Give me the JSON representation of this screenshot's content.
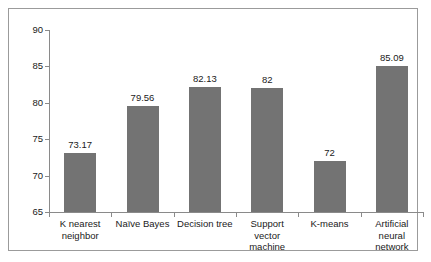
{
  "chart_data": {
    "type": "bar",
    "title": "",
    "subtitle": "",
    "xlabel": "",
    "ylabel": "",
    "categories": [
      "K nearest neighbor",
      "Naïve Bayes",
      "Decision tree",
      "Support vector machine",
      "K-means",
      "Artificial neural network"
    ],
    "category_lines": [
      [
        "K nearest",
        "neighbor"
      ],
      [
        "Naïve Bayes"
      ],
      [
        "Decision tree"
      ],
      [
        "Support",
        "vector",
        "machine"
      ],
      [
        "K-means"
      ],
      [
        "Artificial",
        "neural",
        "network"
      ]
    ],
    "values": [
      73.17,
      79.56,
      82.13,
      82,
      72,
      85.09
    ],
    "value_labels": [
      "73.17",
      "79.56",
      "82.13",
      "82",
      "72",
      "85.09"
    ],
    "ylim": [
      65,
      90
    ],
    "yticks": [
      65,
      70,
      75,
      80,
      85,
      90
    ],
    "ytick_labels": [
      "65",
      "70",
      "75",
      "80",
      "85",
      "90"
    ],
    "grid": false,
    "legend": false,
    "legend_position": "none",
    "bar_color": "#737373",
    "axis_color": "#8a8a8a",
    "text_color": "#1a1a1a",
    "background_color": "#ffffff",
    "frame_color": "#9b9b9b"
  }
}
